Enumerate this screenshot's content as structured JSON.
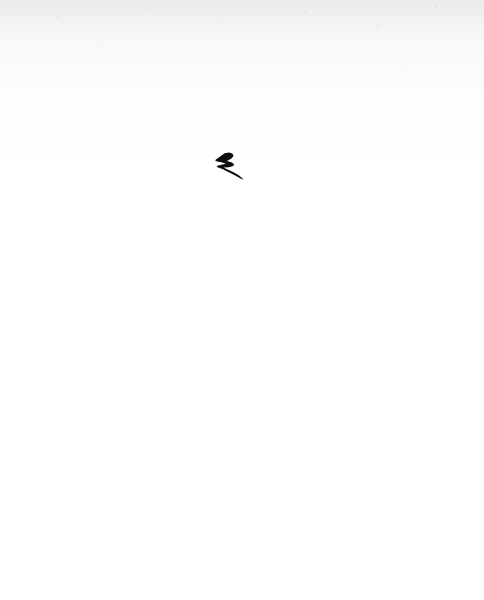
{
  "page": {
    "kind": "scanned-blank-page",
    "width": 484,
    "height": 600,
    "background_color": "#ffffff",
    "paper_tone_color": "#e8e8ea",
    "caption": "",
    "visible_text": ""
  },
  "ink_mark": {
    "name": "lightning-bolt-mark",
    "description": "small hand-inked lightning bolt / zigzag stroke",
    "color": "#0d0d0d",
    "x": 212,
    "y": 151,
    "width": 32,
    "height": 30,
    "rotation_deg": 0
  },
  "artifacts": {
    "scan_shading_label": "",
    "speckle_label": ""
  }
}
